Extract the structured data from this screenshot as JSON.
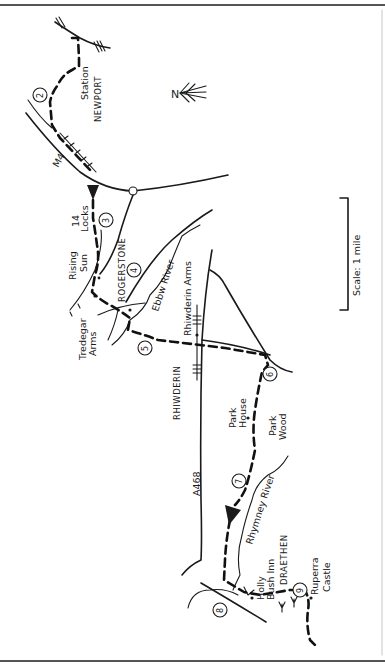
{
  "map": {
    "type": "hand-drawn walking route map",
    "orientation": "rotated 90 degrees, north points right",
    "north_label": "N",
    "scale_label": "Scale: 1 mile",
    "places": {
      "newport": "NEWPORT",
      "station": "Station",
      "rogerstone": "ROGERSTONE",
      "rhiwderin": "RHIWDERIN",
      "draethen": "DRAETHEN"
    },
    "landmarks": {
      "fourteen_locks": [
        "14",
        "Locks"
      ],
      "rising_sun": [
        "Rising",
        "Sun"
      ],
      "tredegar_arms": [
        "Tredegar",
        "Arms"
      ],
      "rhiwderin_arms": "Rhiwderin Arms",
      "park_house": [
        "Park",
        "House"
      ],
      "park_wood": [
        "Park",
        "Wood"
      ],
      "holly_bush_inn": [
        "Holly",
        "Bush Inn"
      ],
      "ruperra_castle": [
        "Ruperra",
        "Castle"
      ]
    },
    "rivers": {
      "ebbw": "Ebbw River",
      "rhymney": "Rhymney River"
    },
    "roads": {
      "a468": "A468",
      "motorway": "M4"
    },
    "waypoints": [
      "2",
      "3",
      "4",
      "5",
      "6",
      "7",
      "8",
      "9"
    ],
    "colors": {
      "ink": "#1a1a1a",
      "paper": "#ffffff",
      "rule": "#555555"
    }
  }
}
